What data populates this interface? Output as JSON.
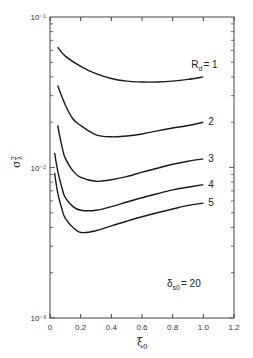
{
  "chart_data": {
    "type": "line",
    "title": "",
    "xlabel": "ξ0",
    "ylabel": "σλ²",
    "xlim": [
      0,
      1.2
    ],
    "ylim": [
      0.001,
      0.1
    ],
    "yscale": "log",
    "grid": false,
    "x_ticks": [
      "0",
      "0.2",
      "0.4",
      "0.6",
      "0.8",
      "1.0",
      "1.2"
    ],
    "y_ticks": [
      "10⁻³",
      "10⁻²",
      "10⁻¹"
    ],
    "annotation": "δs0 = 20",
    "series": [
      {
        "name": "Rd = 1",
        "label": "Rd=1",
        "x": [
          0.05,
          0.1,
          0.2,
          0.3,
          0.4,
          0.5,
          0.6,
          0.7,
          0.8,
          0.9,
          1.0
        ],
        "values": [
          0.063,
          0.055,
          0.047,
          0.042,
          0.039,
          0.0375,
          0.037,
          0.037,
          0.0375,
          0.0385,
          0.04
        ]
      },
      {
        "name": "Rd = 2",
        "label": "2",
        "x": [
          0.05,
          0.1,
          0.15,
          0.2,
          0.3,
          0.4,
          0.5,
          0.6,
          0.7,
          0.8,
          0.9,
          1.0
        ],
        "values": [
          0.035,
          0.026,
          0.021,
          0.019,
          0.0165,
          0.016,
          0.0162,
          0.0167,
          0.0175,
          0.0183,
          0.019,
          0.02
        ]
      },
      {
        "name": "Rd = 3",
        "label": "3",
        "x": [
          0.05,
          0.08,
          0.1,
          0.15,
          0.2,
          0.3,
          0.4,
          0.5,
          0.6,
          0.7,
          0.8,
          0.9,
          1.0
        ],
        "values": [
          0.019,
          0.0135,
          0.0115,
          0.0095,
          0.0086,
          0.0081,
          0.0083,
          0.0087,
          0.0093,
          0.0099,
          0.0105,
          0.011,
          0.0114
        ]
      },
      {
        "name": "Rd = 4",
        "label": "4",
        "x": [
          0.03,
          0.05,
          0.08,
          0.1,
          0.15,
          0.2,
          0.3,
          0.4,
          0.5,
          0.6,
          0.7,
          0.8,
          0.9,
          1.0
        ],
        "values": [
          0.0125,
          0.0095,
          0.0072,
          0.0063,
          0.0055,
          0.0052,
          0.0052,
          0.0055,
          0.0059,
          0.0063,
          0.0067,
          0.0071,
          0.0074,
          0.0077
        ]
      },
      {
        "name": "Rd = 5",
        "label": "5",
        "x": [
          0.03,
          0.05,
          0.08,
          0.1,
          0.15,
          0.2,
          0.3,
          0.4,
          0.5,
          0.6,
          0.7,
          0.8,
          0.9,
          1.0
        ],
        "values": [
          0.0092,
          0.0068,
          0.0052,
          0.0046,
          0.004,
          0.0037,
          0.0038,
          0.0041,
          0.0044,
          0.0047,
          0.005,
          0.0053,
          0.0056,
          0.0058
        ]
      }
    ]
  },
  "labels": {
    "y_axis_symbol": "σ",
    "y_axis_sup": "2",
    "y_axis_sub": "λ",
    "x_axis_symbol": "ξ",
    "x_axis_sub": "0",
    "annotation_delta": "δ",
    "annotation_sub": "s0",
    "annotation_rest": "= 20",
    "rd_prefix": "R",
    "rd_sub": "d",
    "rd_rest": "= 1"
  }
}
